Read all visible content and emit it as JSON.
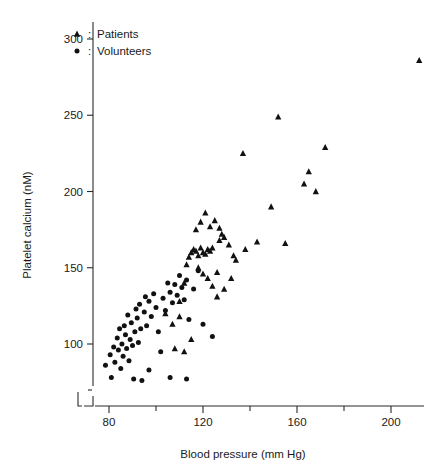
{
  "chart_data": {
    "type": "scatter",
    "title": "",
    "xlabel": "Blood pressure (mm Hg)",
    "ylabel": "Platelet calcium (nM)",
    "xlim": [
      72,
      218
    ],
    "ylim": [
      68,
      312
    ],
    "xticks": [
      80,
      120,
      160,
      200
    ],
    "xticks_minor": [
      100,
      140,
      180
    ],
    "yticks": [
      100,
      150,
      200,
      250,
      300
    ],
    "grid": false,
    "axis_break": true,
    "legend_position": "top-left",
    "legend": [
      {
        "key": "patients",
        "marker": "triangle",
        "label": "Patients",
        "prefix": ":"
      },
      {
        "key": "volunteers",
        "marker": "circle",
        "label": "Volunteers",
        "prefix": ":"
      }
    ],
    "marker_color": "#111111",
    "series": [
      {
        "name": "Volunteers",
        "marker": "circle",
        "points": [
          [
            78.5,
            86
          ],
          [
            80.5,
            93
          ],
          [
            81.0,
            78
          ],
          [
            82.0,
            98
          ],
          [
            82.5,
            88
          ],
          [
            83.5,
            104
          ],
          [
            84.0,
            96
          ],
          [
            84.5,
            110
          ],
          [
            85.0,
            84
          ],
          [
            85.5,
            100
          ],
          [
            86.0,
            92
          ],
          [
            86.5,
            112
          ],
          [
            87.0,
            106
          ],
          [
            87.5,
            97
          ],
          [
            88.0,
            119
          ],
          [
            88.5,
            89
          ],
          [
            89.0,
            103
          ],
          [
            89.5,
            114
          ],
          [
            90.0,
            99
          ],
          [
            90.5,
            77
          ],
          [
            91.0,
            108
          ],
          [
            91.5,
            123
          ],
          [
            92.0,
            117
          ],
          [
            92.5,
            101
          ],
          [
            93.0,
            126
          ],
          [
            93.5,
            110
          ],
          [
            94.0,
            76
          ],
          [
            95.0,
            121
          ],
          [
            95.5,
            131
          ],
          [
            96.0,
            112
          ],
          [
            97.0,
            128
          ],
          [
            98.0,
            118
          ],
          [
            99.0,
            133
          ],
          [
            100.0,
            124
          ],
          [
            101.0,
            108
          ],
          [
            102.0,
            95
          ],
          [
            103.0,
            130
          ],
          [
            104.0,
            122
          ],
          [
            105.0,
            140
          ],
          [
            106.0,
            134
          ],
          [
            107.0,
            127
          ],
          [
            108.0,
            139
          ],
          [
            109.0,
            132
          ],
          [
            110.0,
            145
          ],
          [
            111.0,
            137
          ],
          [
            112.0,
            129
          ],
          [
            113.0,
            142
          ],
          [
            114.0,
            116
          ],
          [
            116.0,
            136
          ],
          [
            118.0,
            148
          ],
          [
            120.0,
            113
          ],
          [
            124.0,
            105
          ],
          [
            106.0,
            78
          ],
          [
            113.0,
            77
          ],
          [
            97.0,
            83
          ]
        ]
      },
      {
        "name": "Patients",
        "marker": "triangle",
        "points": [
          [
            104.0,
            120
          ],
          [
            107.0,
            113
          ],
          [
            110.0,
            128
          ],
          [
            112.0,
            140
          ],
          [
            113.0,
            152
          ],
          [
            114.0,
            157
          ],
          [
            115.0,
            160
          ],
          [
            116.0,
            162
          ],
          [
            117.0,
            161
          ],
          [
            118.0,
            158
          ],
          [
            119.0,
            163
          ],
          [
            120.0,
            160
          ],
          [
            121.0,
            159
          ],
          [
            122.0,
            162
          ],
          [
            123.0,
            161
          ],
          [
            124.0,
            163
          ],
          [
            118.0,
            150
          ],
          [
            120.0,
            146
          ],
          [
            122.0,
            143
          ],
          [
            124.0,
            138
          ],
          [
            126.0,
            147
          ],
          [
            127.0,
            168
          ],
          [
            128.0,
            172
          ],
          [
            117.0,
            175
          ],
          [
            119.0,
            180
          ],
          [
            121.0,
            186
          ],
          [
            123.0,
            177
          ],
          [
            125.0,
            181
          ],
          [
            127.0,
            176
          ],
          [
            129.0,
            170
          ],
          [
            131.0,
            165
          ],
          [
            133.0,
            158
          ],
          [
            126.0,
            131
          ],
          [
            129.0,
            136
          ],
          [
            132.0,
            143
          ],
          [
            134.0,
            155
          ],
          [
            137.0,
            225
          ],
          [
            138.0,
            162
          ],
          [
            143.0,
            167
          ],
          [
            149.0,
            190
          ],
          [
            152.0,
            249
          ],
          [
            155.0,
            166
          ],
          [
            163.0,
            205
          ],
          [
            165.0,
            213
          ],
          [
            168.0,
            200
          ],
          [
            172.0,
            229
          ],
          [
            212.0,
            286
          ],
          [
            110.0,
            118
          ],
          [
            108.0,
            97
          ],
          [
            112.0,
            95
          ],
          [
            115.0,
            103
          ]
        ]
      }
    ]
  }
}
